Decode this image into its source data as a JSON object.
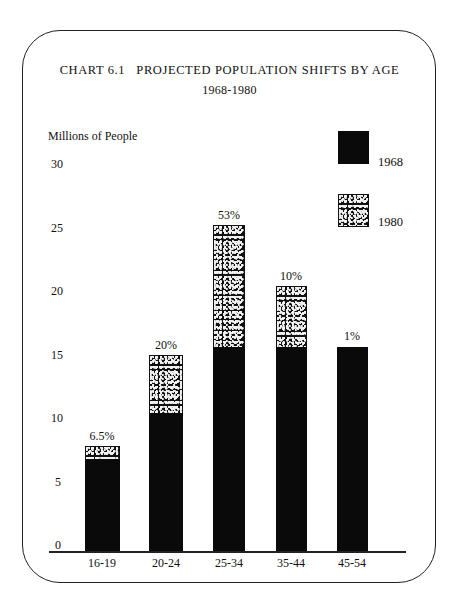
{
  "page": {
    "title": "CHART 6.1   PROJECTED POPULATION SHIFTS BY AGE",
    "subtitle": "1968-1980"
  },
  "chart_data": {
    "type": "bar",
    "stacked": true,
    "title": "CHART 6.1 PROJECTED POPULATION SHIFTS BY AGE",
    "subtitle": "1968-1980",
    "xlabel": "",
    "ylabel": "Millions of People",
    "ylim": [
      0,
      30
    ],
    "yticks": [
      0,
      5,
      10,
      15,
      20,
      25,
      30
    ],
    "grid": false,
    "legend_position": "top-right",
    "categories": [
      "16-19",
      "20-24",
      "25-34",
      "35-44",
      "45-54"
    ],
    "series": [
      {
        "name": "1968",
        "fill": "solid black",
        "values": [
          7.0,
          10.6,
          15.8,
          15.8,
          15.8
        ]
      },
      {
        "name": "1980",
        "fill": "speckled pattern",
        "values": [
          8.0,
          15.2,
          25.4,
          20.6,
          15.9
        ]
      }
    ],
    "annotations": [
      "6.5%",
      "20%",
      "53%",
      "10%",
      "1%"
    ]
  },
  "legend": [
    {
      "label": "1968",
      "style": "solid"
    },
    {
      "label": "1980",
      "style": "pattern"
    }
  ],
  "colors": {
    "bar": "#0a0a0a",
    "background": "#ffffff",
    "speckle": "#f2f2f2"
  }
}
